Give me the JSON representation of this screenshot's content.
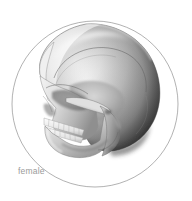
{
  "figure": {
    "caption_label": "female",
    "background_color": "#ffffff",
    "frame": {
      "shape": "circle",
      "stroke_color": "#9e9e9e",
      "stroke_width": 0.8,
      "center_x": 95,
      "center_y": 104,
      "radius": 83
    },
    "subject": {
      "type": "skull-lateral-render",
      "orientation": "facing-left",
      "sex_label": "female",
      "render_style": "grayscale-3d-shaded",
      "palette": {
        "highlight": "#ffffff",
        "light_bone": "#e9e9e9",
        "mid_bone": "#b9b9b9",
        "shadow_bone": "#7d7d7d",
        "deep_shadow": "#3a3a3a",
        "occipital_dark": "#1f1f1f",
        "outline": "#5c5c5c"
      },
      "parts": [
        "cranial-vault",
        "coronal-suture",
        "frontal-bone",
        "orbit",
        "nasal-aperture",
        "zygomatic-arch",
        "maxilla",
        "upper-teeth",
        "lower-teeth",
        "mandible",
        "mandibular-ramus",
        "temporal-bone",
        "occipital-bone"
      ]
    }
  }
}
